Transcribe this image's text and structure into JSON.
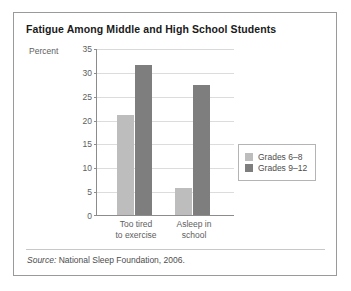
{
  "chart_data": {
    "type": "bar",
    "title": "Fatigue Among Middle and High School Students",
    "xlabel": "",
    "ylabel": "Percent",
    "ylim": [
      0,
      35
    ],
    "yticks": [
      0,
      5,
      10,
      15,
      20,
      25,
      30,
      35
    ],
    "grid": true,
    "legend_position": "right",
    "categories": [
      "Too tired to exercise",
      "Asleep in school"
    ],
    "category_lines": [
      [
        "Too tired",
        "to exercise"
      ],
      [
        "Asleep in",
        "school"
      ]
    ],
    "series": [
      {
        "name": "Grades 6–8",
        "color": "#bdbdbd",
        "values": [
          21,
          5.7
        ]
      },
      {
        "name": "Grades 9–12",
        "color": "#7e7e7e",
        "values": [
          31.5,
          27.3
        ]
      }
    ],
    "source_note_prefix": "Source:",
    "source_note_text": " National Sleep Foundation, 2006."
  },
  "legend": {
    "items": [
      {
        "label": "Grades 6–8"
      },
      {
        "label": "Grades 9–12"
      }
    ]
  },
  "axis": {
    "unit_label": "Percent",
    "tick_0": "0",
    "tick_5": "5",
    "tick_10": "10",
    "tick_15": "15",
    "tick_20": "20",
    "tick_25": "25",
    "tick_30": "30",
    "tick_35": "35"
  },
  "colors": {
    "series_light": "#bdbdbd",
    "series_dark": "#7e7e7e",
    "frame": "#9a9a9a",
    "grid": "#dcdcdc",
    "text": "#5e5e5e"
  }
}
